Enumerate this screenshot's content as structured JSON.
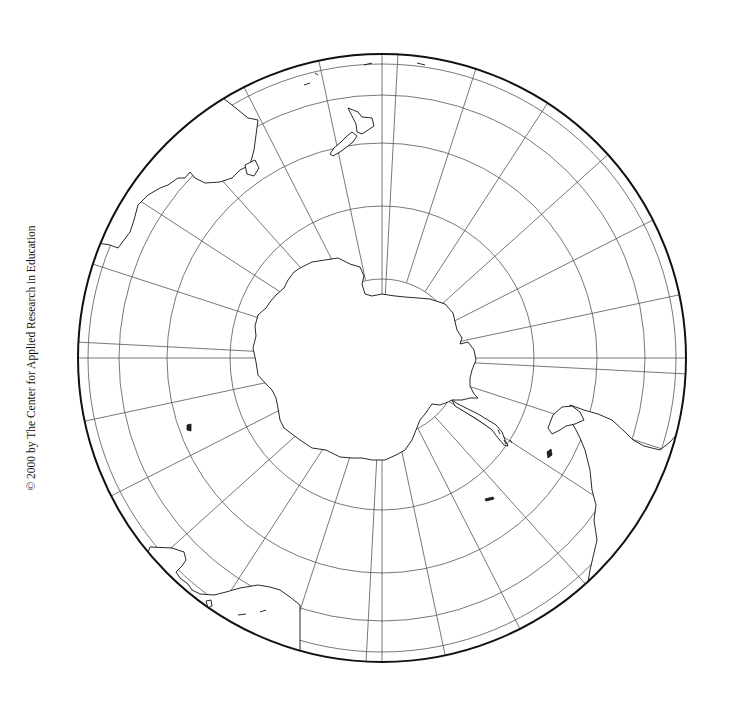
{
  "map": {
    "title": "Southern Hemisphere polar orthographic outline map",
    "projection": "orthographic, south-polar aspect",
    "center": {
      "x": 382,
      "y": 358
    },
    "radius": 304,
    "colors": {
      "land": "#ffffff",
      "ocean": "#ffffff",
      "coast": "#111111",
      "graticule": "#555555",
      "edge": "#111111"
    },
    "graticule": {
      "parallels_deg_south": [
        75,
        60,
        45,
        30,
        15
      ],
      "parallel_radii_px": [
        79,
        152,
        215,
        263,
        294
      ],
      "meridian_step_deg": 15,
      "meridian_count": 24
    },
    "landmasses": [
      {
        "name": "Antarctica"
      },
      {
        "name": "Australia"
      },
      {
        "name": "Tasmania"
      },
      {
        "name": "New Zealand"
      },
      {
        "name": "South America"
      },
      {
        "name": "Tierra del Fuego"
      },
      {
        "name": "Falkland Islands"
      },
      {
        "name": "South Georgia"
      },
      {
        "name": "Southern Africa"
      },
      {
        "name": "Madagascar"
      },
      {
        "name": "Kerguelen Islands"
      }
    ]
  },
  "copyright": "© 2000 by The Center for Applied Research in Education"
}
